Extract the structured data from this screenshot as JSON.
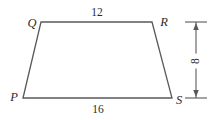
{
  "figure": {
    "type": "geometry-diagram",
    "shape": "trapezoid",
    "name": "PQRS",
    "background_color": "#ffffff",
    "stroke_color": "#59595b",
    "text_color": "#2b2b2b",
    "vertices": [
      {
        "id": "P",
        "label": "P",
        "x": 23,
        "y": 98,
        "label_x": 14,
        "label_y": 97
      },
      {
        "id": "Q",
        "label": "Q",
        "x": 41,
        "y": 22,
        "label_x": 32,
        "label_y": 23
      },
      {
        "id": "R",
        "label": "R",
        "x": 152,
        "y": 22,
        "label_x": 164,
        "label_y": 22
      },
      {
        "id": "S",
        "label": "S",
        "x": 172,
        "y": 98,
        "label_x": 179,
        "label_y": 100
      }
    ],
    "side_labels": [
      {
        "id": "QR",
        "text": "12",
        "x": 97,
        "y": 13,
        "side": "top",
        "orientation": "horizontal"
      },
      {
        "id": "PS",
        "text": "16",
        "x": 98,
        "y": 110,
        "side": "bottom",
        "orientation": "horizontal"
      }
    ],
    "dimension": {
      "id": "height",
      "text": "8",
      "orientation": "vertical",
      "line_x": 196,
      "top_y": 22,
      "bottom_y": 98,
      "tick_half_width": 7,
      "label_x": 196,
      "label_y": 61
    }
  },
  "chart_data": {
    "type": "table",
    "categories": [
      "QR (top side)",
      "PS (bottom side)",
      "height"
    ],
    "values": [
      12,
      16,
      8
    ],
    "annotations": [
      "12",
      "16",
      "8"
    ],
    "legend": [
      "P",
      "Q",
      "R",
      "S"
    ],
    "xlabel": "",
    "ylabel": ""
  }
}
